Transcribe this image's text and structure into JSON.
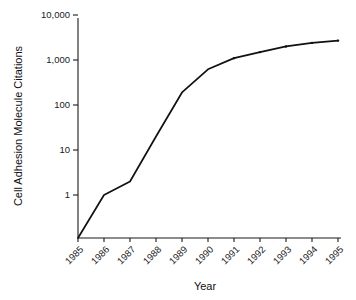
{
  "chart_data": {
    "type": "line",
    "title": "",
    "xlabel": "Year",
    "ylabel": "Cell Adhesion Molecule Citations",
    "x": [
      "1985",
      "1986",
      "1987",
      "1988",
      "1989",
      "1990",
      "1991",
      "1992",
      "1993",
      "1994",
      "1995"
    ],
    "values": [
      0,
      1,
      2,
      20,
      190,
      620,
      1100,
      1500,
      2000,
      2400,
      2700
    ],
    "yscale": "log",
    "ylim": [
      1,
      10000
    ],
    "ytick_labels": [
      "10,000",
      "1,000",
      "100",
      "10",
      "1"
    ],
    "ytick_values": [
      10000,
      1000,
      100,
      10,
      1
    ],
    "xtick_labels": [
      "1985",
      "1986",
      "1987",
      "1988",
      "1989",
      "1990",
      "1991",
      "1992",
      "1993",
      "1994",
      "1995"
    ],
    "grid": false,
    "legend": null,
    "series": [
      {
        "name": "Cell Adhesion Molecule Citations",
        "color": "#111111",
        "values": [
          0,
          1,
          2,
          20,
          190,
          620,
          1100,
          1500,
          2000,
          2400,
          2700
        ]
      }
    ],
    "annotations": []
  },
  "axes": {
    "y_title": "Cell Adhesion Molecule Citations",
    "x_title": "Year"
  },
  "colors": {
    "line": "#111111",
    "axis": "#1a1a1a",
    "background": "#ffffff"
  }
}
